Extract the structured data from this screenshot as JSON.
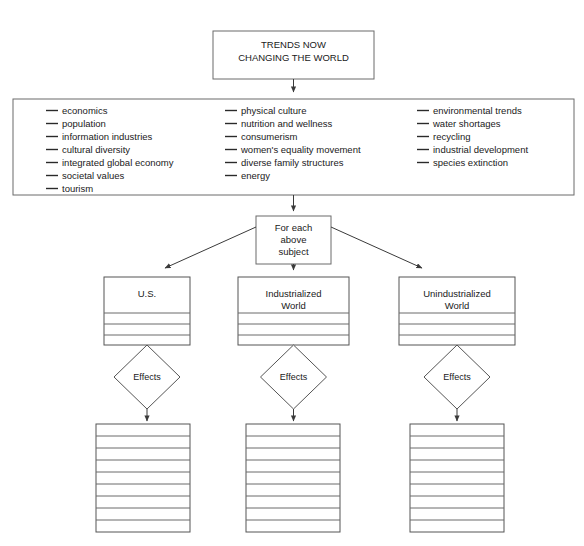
{
  "diagram": {
    "title_box": {
      "line1": "TRENDS NOW",
      "line2": "CHANGING THE WORLD"
    },
    "trend_columns": [
      {
        "items": [
          "economics",
          "population",
          "information industries",
          "cultural diversity",
          "integrated global economy",
          "societal values",
          "tourism"
        ]
      },
      {
        "items": [
          "physical culture",
          "nutrition and wellness",
          "consumerism",
          "women's equality movement",
          "diverse family structures",
          "energy"
        ]
      },
      {
        "items": [
          "environmental trends",
          "water shortages",
          "recycling",
          "industrial development",
          "species extinction"
        ]
      }
    ],
    "subject_box": {
      "line1": "For each",
      "line2": "above",
      "line3": "subject"
    },
    "categories": [
      {
        "line1": "U.S.",
        "line2": "",
        "blank_rows": 3,
        "effects_label": "Effects",
        "result_rows": 9
      },
      {
        "line1": "Industrialized",
        "line2": "World",
        "blank_rows": 3,
        "effects_label": "Effects",
        "result_rows": 9
      },
      {
        "line1": "Unindustrialized",
        "line2": "World",
        "blank_rows": 3,
        "effects_label": "Effects",
        "result_rows": 9
      }
    ],
    "colors": {
      "background": "#ffffff",
      "box_stroke": "#6b6b6b",
      "connector": "#3a3a3a",
      "text": "#1a1a1a"
    }
  }
}
